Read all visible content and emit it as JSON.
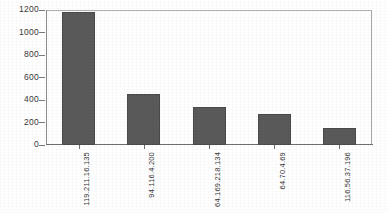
{
  "chart_data": {
    "type": "bar",
    "title": "",
    "xlabel": "",
    "ylabel": "",
    "ylim": [
      0,
      1200
    ],
    "yticks": [
      0,
      200,
      400,
      600,
      800,
      1000,
      1200
    ],
    "ytick_labels": [
      "0",
      "200",
      "400",
      "600",
      "800",
      "1000",
      "1200"
    ],
    "grid": false,
    "legend": false,
    "bar_color": "#5a5a5a",
    "bar_edge_color": "#4a4a4a",
    "frame_color": "#9a9a9a",
    "categories": [
      "119.211.16.135",
      "94.116.4.200",
      "64.169.218.134",
      "64.70.4.69",
      "116.56.37.196"
    ],
    "values": [
      1180,
      455,
      340,
      275,
      155
    ],
    "bars": [
      {
        "label": "119.211.16.135",
        "value": 1180
      },
      {
        "label": "94.116.4.200",
        "value": 455
      },
      {
        "label": "64.169.218.134",
        "value": 340
      },
      {
        "label": "64.70.4.69",
        "value": 275
      },
      {
        "label": "116.56.37.196",
        "value": 155
      }
    ]
  }
}
